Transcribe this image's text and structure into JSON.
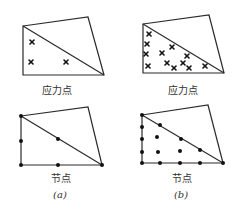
{
  "figure": {
    "panels": [
      {
        "id": "a",
        "caption": "(a)",
        "stress": {
          "label": "应力点",
          "quad": [
            [
              23,
              26
            ],
            [
              88,
              17
            ],
            [
              104,
              75
            ],
            [
              23,
              75
            ]
          ],
          "diagonal": [
            [
              23,
              26
            ],
            [
              104,
              75
            ]
          ],
          "points": [
            [
              32,
              42
            ],
            [
              31,
              62
            ],
            [
              66,
              62
            ]
          ]
        },
        "nodes": {
          "label": "节点",
          "quad": [
            [
              21,
              116
            ],
            [
              88,
              107
            ],
            [
              102,
              165
            ],
            [
              21,
              165
            ]
          ],
          "diagonal": [
            [
              21,
              116
            ],
            [
              102,
              165
            ]
          ],
          "points": [
            [
              21,
              116
            ],
            [
              21,
              141
            ],
            [
              21,
              165
            ],
            [
              58,
              139
            ],
            [
              58,
              165
            ],
            [
              102,
              165
            ]
          ]
        }
      },
      {
        "id": "b",
        "caption": "(b)",
        "stress": {
          "label": "应力点",
          "quad": [
            [
              143,
              24
            ],
            [
              209,
              15
            ],
            [
              224,
              73
            ],
            [
              143,
              73
            ]
          ],
          "diagonal": [
            [
              143,
              24
            ],
            [
              224,
              73
            ]
          ],
          "points": [
            [
              149,
              34
            ],
            [
              147,
              44
            ],
            [
              146,
              54
            ],
            [
              148,
              66
            ],
            [
              172,
              47
            ],
            [
              162,
              53
            ],
            [
              187,
              56
            ],
            [
              167,
              63
            ],
            [
              174,
              68
            ],
            [
              183,
              63
            ],
            [
              189,
              68
            ],
            [
              205,
              66
            ]
          ]
        },
        "nodes": {
          "label": "节点",
          "quad": [
            [
              142,
              115
            ],
            [
              208,
              105
            ],
            [
              223,
              163
            ],
            [
              142,
              163
            ]
          ],
          "diagonal": [
            [
              142,
              115
            ],
            [
              223,
              163
            ]
          ],
          "points": [
            [
              142,
              115
            ],
            [
              142,
              127
            ],
            [
              142,
              139
            ],
            [
              142,
              152
            ],
            [
              142,
              163
            ],
            [
              160,
              125
            ],
            [
              181,
              139
            ],
            [
              200,
              150
            ],
            [
              223,
              163
            ],
            [
              157,
              137
            ],
            [
              158,
              152
            ],
            [
              180,
              151
            ],
            [
              160,
              163
            ],
            [
              180,
              163
            ],
            [
              200,
              163
            ]
          ]
        }
      }
    ],
    "labels": {
      "a_stress": "应力点",
      "b_stress": "应力点",
      "a_nodes": "节点",
      "b_nodes": "节点",
      "a_caption": "(a)",
      "b_caption": "(b)"
    }
  }
}
